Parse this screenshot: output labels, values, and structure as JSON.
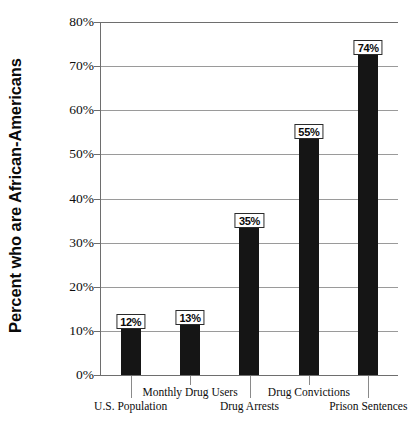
{
  "chart_data": {
    "type": "bar",
    "title": "",
    "xlabel": "",
    "ylabel": "Percent who are African-Americans",
    "ylim": [
      0,
      80
    ],
    "grid": true,
    "legend": false,
    "categories": [
      "U.S. Population",
      "Monthly Drug Users",
      "Drug Arrests",
      "Drug Convictions",
      "Prison Sentences"
    ],
    "values": [
      12,
      13,
      35,
      55,
      74
    ],
    "value_labels": [
      "12%",
      "13%",
      "35%",
      "55%",
      "74%"
    ],
    "ytick_labels": [
      "0%",
      "10%",
      "20%",
      "30%",
      "40%",
      "50%",
      "60%",
      "70%",
      "80%"
    ],
    "ytick_values": [
      0,
      10,
      20,
      30,
      40,
      50,
      60,
      70,
      80
    ]
  },
  "colors": {
    "bar": "#151515",
    "gridline": "#9a9a9a",
    "axis": "#6e6e6e",
    "background": "#ffffff",
    "text": "#0d0d0d"
  }
}
